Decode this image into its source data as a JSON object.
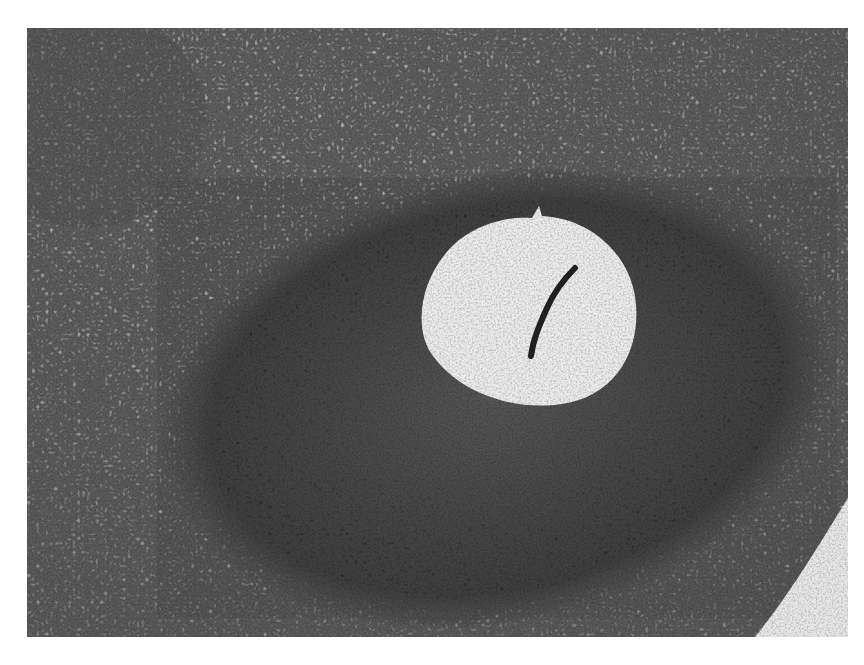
{
  "image": {
    "kind": "grayscale histology micrograph",
    "description": "Tissue section showing a dark, densely cellular oval zone surrounding a round clear lumen with a thin dark strand inside; lighter loose stromal tissue around the periphery; a clear space at the lower right corner.",
    "colors": {
      "page_background": "#ffffff",
      "stroma": "#9a9a9a",
      "dense_zone": "#3a3a3a",
      "lumen": "#ececec",
      "nuclei": "#1e1e1e"
    },
    "regions": {
      "photo": {
        "x": 27,
        "y": 28,
        "w": 821,
        "h": 609
      },
      "dense_zone": {
        "cx": 470,
        "cy": 370,
        "rx": 330,
        "ry": 210
      },
      "lumen": {
        "cx": 525,
        "cy": 310,
        "rx": 97,
        "ry": 93
      }
    }
  }
}
